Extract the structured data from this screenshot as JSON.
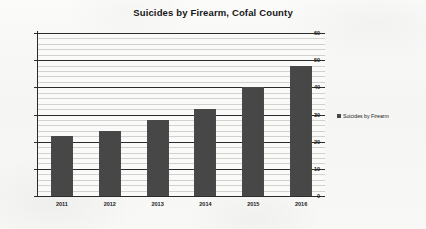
{
  "chart_data": {
    "type": "bar",
    "title": "Suicides by Firearm, Cofal County",
    "xlabel": "",
    "ylabel": "",
    "categories": [
      "2011",
      "2012",
      "2013",
      "2014",
      "2015",
      "2016"
    ],
    "values": [
      22,
      24,
      28,
      32,
      40,
      48
    ],
    "series": [
      {
        "name": "Suicides by Firearm",
        "values": [
          22,
          24,
          28,
          32,
          40,
          48
        ]
      }
    ],
    "ylim": [
      0,
      60
    ],
    "ytick_labels": [
      "0",
      "10",
      "20",
      "30",
      "40",
      "50",
      "60"
    ],
    "ytick_values": [
      0,
      10,
      20,
      30,
      40,
      50,
      60
    ],
    "minor_tick_step": 2,
    "grid": true,
    "legend_position": "right",
    "bar_color": "#474747",
    "grid_major_color": "#2b2b2b",
    "grid_minor_color": "#c9c9c6",
    "background_color": "#f7f7f5"
  },
  "legend": {
    "entries": [
      {
        "label": "Suicides by Firearm",
        "color": "#474747"
      }
    ]
  }
}
